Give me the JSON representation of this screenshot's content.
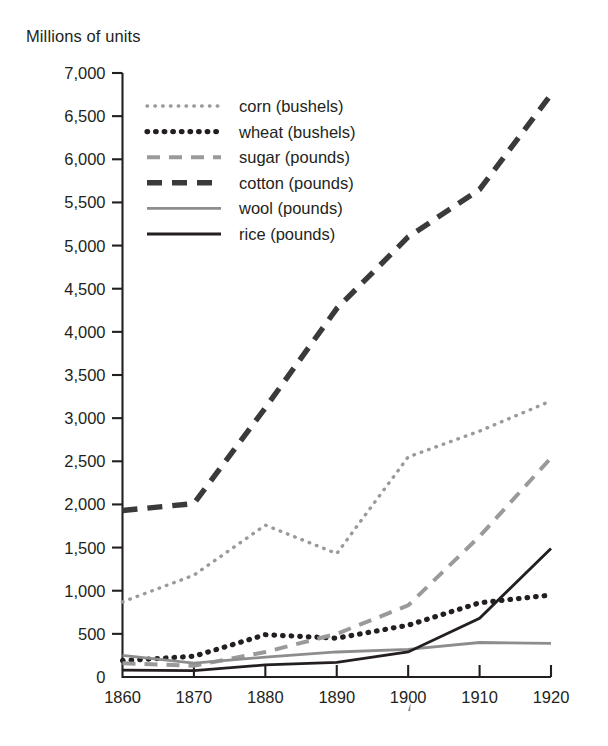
{
  "chart_data": {
    "type": "line",
    "title": "",
    "subtitle": "",
    "ylabel": "Millions of units",
    "xlabel": "",
    "x": [
      1860,
      1870,
      1880,
      1890,
      1900,
      1910,
      1920
    ],
    "categories": [
      "1860",
      "1870",
      "1880",
      "1890",
      "1900",
      "1910",
      "1920"
    ],
    "xlim": [
      1860,
      1920
    ],
    "ylim": [
      0,
      7000
    ],
    "ytick_step": 500,
    "yticks": [
      0,
      500,
      1000,
      1500,
      2000,
      2500,
      3000,
      3500,
      4000,
      4500,
      5000,
      5500,
      6000,
      6500,
      7000
    ],
    "ytick_labels": [
      "0",
      "500",
      "1,000",
      "1,500",
      "2,000",
      "2,500",
      "3,000",
      "3,500",
      "4,000",
      "4,500",
      "5,000",
      "5,500",
      "6,000",
      "6,500",
      "7,000"
    ],
    "xtick_labels": [
      "1860",
      "1870",
      "1880",
      "1890",
      "1900",
      "1910",
      "1920"
    ],
    "grid": false,
    "legend_position": "upper-left-inside",
    "series": [
      {
        "name": "corn (bushels)",
        "label": "corn (bushels)",
        "style": "dotted-fine",
        "color": "#9a9a9a",
        "values": [
          870,
          1180,
          1760,
          1430,
          2550,
          2850,
          3200
        ]
      },
      {
        "name": "wheat (bushels)",
        "label": "wheat (bushels)",
        "style": "dotted-bold",
        "color": "#231f20",
        "values": [
          190,
          240,
          490,
          450,
          600,
          860,
          950
        ]
      },
      {
        "name": "sugar (pounds)",
        "label": "sugar (pounds)",
        "style": "dashed-light",
        "color": "#9a9a9a",
        "values": [
          160,
          130,
          290,
          500,
          830,
          1630,
          2540
        ]
      },
      {
        "name": "cotton (pounds)",
        "label": "cotton (pounds)",
        "style": "dashed-bold",
        "color": "#3a3a3c",
        "values": [
          1930,
          2010,
          3120,
          4270,
          5100,
          5650,
          6750
        ]
      },
      {
        "name": "wool (pounds)",
        "label": "wool (pounds)",
        "style": "solid-thin-gray",
        "color": "#8d8d8d",
        "values": [
          250,
          160,
          230,
          290,
          320,
          400,
          390
        ]
      },
      {
        "name": "rice (pounds)",
        "label": "rice (pounds)",
        "style": "solid-thin-dark",
        "color": "#231f20",
        "values": [
          80,
          75,
          140,
          170,
          290,
          680,
          1490
        ]
      }
    ]
  },
  "axis": {
    "y_axis_title": "Millions of units"
  }
}
